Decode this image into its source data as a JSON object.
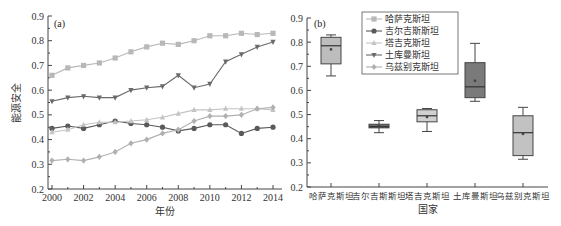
{
  "chart_data": [
    {
      "type": "line",
      "panel_label": "(a)",
      "title": "",
      "xlabel": "年份",
      "ylabel": "能源安全",
      "x": [
        2000,
        2001,
        2002,
        2003,
        2004,
        2005,
        2006,
        2007,
        2008,
        2009,
        2010,
        2011,
        2012,
        2013,
        2014
      ],
      "x_tick_labels": [
        "2000",
        "2002",
        "2004",
        "2006",
        "2008",
        "2010",
        "2012",
        "2014"
      ],
      "ylim": [
        0.2,
        0.9
      ],
      "y_tick_labels": [
        "0.2",
        "0.3",
        "0.4",
        "0.5",
        "0.6",
        "0.7",
        "0.8",
        "0.9"
      ],
      "grid": false,
      "series": [
        {
          "name": "哈萨克斯坦",
          "marker": "square",
          "color": "#b8b8b8",
          "values": [
            0.66,
            0.69,
            0.7,
            0.71,
            0.73,
            0.755,
            0.775,
            0.79,
            0.785,
            0.8,
            0.82,
            0.82,
            0.83,
            0.825,
            0.83
          ]
        },
        {
          "name": "吉尔吉斯斯坦",
          "marker": "circle",
          "color": "#5a5a5a",
          "values": [
            0.445,
            0.455,
            0.445,
            0.46,
            0.475,
            0.465,
            0.46,
            0.45,
            0.435,
            0.445,
            0.46,
            0.46,
            0.425,
            0.445,
            0.45
          ]
        },
        {
          "name": "塔吉克斯坦",
          "marker": "triangle-up",
          "color": "#c4c4c4",
          "values": [
            0.43,
            0.44,
            0.46,
            0.47,
            0.47,
            0.475,
            0.48,
            0.49,
            0.505,
            0.52,
            0.52,
            0.525,
            0.525,
            0.525,
            0.52
          ]
        },
        {
          "name": "土库曼斯坦",
          "marker": "triangle-down",
          "color": "#6a6a6a",
          "values": [
            0.555,
            0.57,
            0.575,
            0.57,
            0.57,
            0.6,
            0.61,
            0.615,
            0.66,
            0.61,
            0.625,
            0.715,
            0.745,
            0.775,
            0.795
          ]
        },
        {
          "name": "乌兹别克斯坦",
          "marker": "diamond",
          "color": "#b0b0b0",
          "values": [
            0.315,
            0.32,
            0.315,
            0.33,
            0.35,
            0.385,
            0.4,
            0.425,
            0.44,
            0.475,
            0.495,
            0.495,
            0.5,
            0.525,
            0.53
          ]
        }
      ]
    },
    {
      "type": "box",
      "panel_label": "(b)",
      "title": "",
      "xlabel": "国家",
      "ylabel": "",
      "categories": [
        "哈萨克斯坦",
        "吉尔吉斯斯坦",
        "塔吉克斯坦",
        "土库曼斯坦",
        "乌兹别克斯坦"
      ],
      "ylim": [
        0.2,
        0.9
      ],
      "y_tick_labels": [
        "0.2",
        "0.3",
        "0.4",
        "0.5",
        "0.6",
        "0.7",
        "0.8",
        "0.9"
      ],
      "legend": {
        "position": "top-left-inside",
        "entries": [
          "哈萨克斯坦",
          "吉尔吉斯斯坦",
          "塔吉克斯坦",
          "土库曼斯坦",
          "乌兹别克斯坦"
        ]
      },
      "boxes": [
        {
          "name": "哈萨克斯坦",
          "min": 0.66,
          "q1": 0.71,
          "median": 0.785,
          "q3": 0.82,
          "max": 0.83,
          "mean": 0.77,
          "color": "#bdbdbd"
        },
        {
          "name": "吉尔吉斯斯坦",
          "min": 0.425,
          "q1": 0.445,
          "median": 0.45,
          "q3": 0.46,
          "max": 0.475,
          "mean": 0.452,
          "color": "#6b6b6b"
        },
        {
          "name": "塔吉克斯坦",
          "min": 0.43,
          "q1": 0.47,
          "median": 0.495,
          "q3": 0.52,
          "max": 0.525,
          "mean": 0.49,
          "color": "#d0d0d0"
        },
        {
          "name": "土库曼斯坦",
          "min": 0.555,
          "q1": 0.57,
          "median": 0.615,
          "q3": 0.715,
          "max": 0.795,
          "mean": 0.64,
          "color": "#7a7a7a"
        },
        {
          "name": "乌兹别克斯坦",
          "min": 0.315,
          "q1": 0.33,
          "median": 0.425,
          "q3": 0.495,
          "max": 0.53,
          "mean": 0.42,
          "color": "#c2c2c2"
        }
      ]
    }
  ]
}
